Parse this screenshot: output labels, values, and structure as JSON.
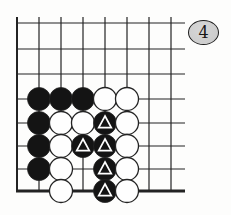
{
  "figure": {
    "number": "4"
  },
  "colors": {
    "background": "#fdfdfc",
    "line": "#232323",
    "badge_fill": "#c9c9c9",
    "badge_fill_light": "#d6d6d6",
    "badge_border": "#1c1c1c",
    "black_stone": "#141414",
    "white_stone": "#fefefe",
    "stone_outline": "#232323",
    "triangle_mark": "#ffffff"
  },
  "board": {
    "grid_cols": 8,
    "grid_rows": 8,
    "edges": {
      "left": true,
      "bottom": true,
      "top": false,
      "right": false
    },
    "stones": [
      {
        "col": 2,
        "row": 4,
        "color": "black"
      },
      {
        "col": 3,
        "row": 4,
        "color": "black"
      },
      {
        "col": 4,
        "row": 4,
        "color": "black"
      },
      {
        "col": 5,
        "row": 4,
        "color": "white"
      },
      {
        "col": 6,
        "row": 4,
        "color": "white"
      },
      {
        "col": 2,
        "row": 5,
        "color": "black"
      },
      {
        "col": 3,
        "row": 5,
        "color": "white"
      },
      {
        "col": 4,
        "row": 5,
        "color": "white"
      },
      {
        "col": 5,
        "row": 5,
        "color": "black",
        "mark": "triangle"
      },
      {
        "col": 6,
        "row": 5,
        "color": "white"
      },
      {
        "col": 2,
        "row": 6,
        "color": "black"
      },
      {
        "col": 3,
        "row": 6,
        "color": "white"
      },
      {
        "col": 4,
        "row": 6,
        "color": "black",
        "mark": "triangle"
      },
      {
        "col": 5,
        "row": 6,
        "color": "black",
        "mark": "triangle"
      },
      {
        "col": 6,
        "row": 6,
        "color": "white"
      },
      {
        "col": 2,
        "row": 7,
        "color": "black"
      },
      {
        "col": 3,
        "row": 7,
        "color": "white"
      },
      {
        "col": 5,
        "row": 7,
        "color": "black",
        "mark": "triangle"
      },
      {
        "col": 6,
        "row": 7,
        "color": "white"
      },
      {
        "col": 3,
        "row": 8,
        "color": "white"
      },
      {
        "col": 5,
        "row": 8,
        "color": "black",
        "mark": "triangle"
      },
      {
        "col": 6,
        "row": 8,
        "color": "white"
      }
    ]
  }
}
